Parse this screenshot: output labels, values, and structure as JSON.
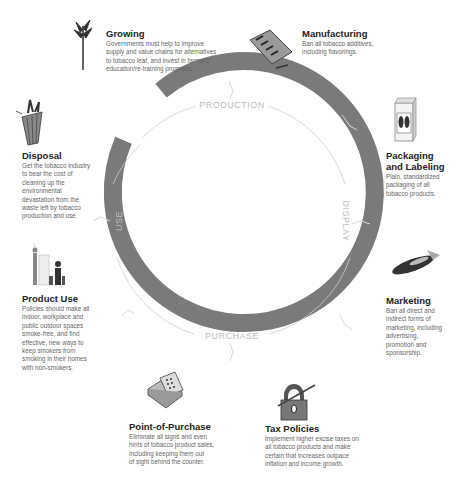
{
  "diagram": {
    "ring": {
      "center": [
        231,
        221
      ],
      "outer_radius": 140,
      "thickness": 18,
      "inner_guide_radius": 119,
      "ring_color": "#7a7a7a",
      "guide_color": "#cfcfcf",
      "label_color": "#bdbdbd"
    },
    "phases": [
      {
        "label": "PRODUCTION"
      },
      {
        "label": "DISPLAY"
      },
      {
        "label": "PURCHASE"
      },
      {
        "label": "USE"
      }
    ],
    "stages": [
      {
        "id": "growing",
        "title": "Growing",
        "lines": [
          "Governments must help to improve",
          "supply and value chains for alternatives",
          "to tobacco leaf, and invest in farmers’",
          "education/re-training programs."
        ],
        "icon": "tobacco-plant-icon"
      },
      {
        "id": "manufacturing",
        "title": "Manufacturing",
        "lines": [
          "Ban all tobacco additives,",
          "including flavorings."
        ],
        "icon": "cigarette-machine-icon"
      },
      {
        "id": "packaging",
        "title_lines": [
          "Packaging",
          "and Labeling"
        ],
        "lines": [
          "Plain, standardized",
          "packaging of all",
          "tobacco products."
        ],
        "icon": "cigarette-pack-icon"
      },
      {
        "id": "marketing",
        "title": "Marketing",
        "lines": [
          "Ban all direct and",
          "indirect forms of",
          "marketing, including",
          "advertising,",
          "promotion and",
          "sponsorship."
        ],
        "icon": "blimp-icon"
      },
      {
        "id": "tax",
        "title": "Tax Policies",
        "lines": [
          "Implement higher excise taxes on",
          "all tobacco products and make",
          "certain that increases outpace",
          "inflation and income growth."
        ],
        "icon": "padlock-icon"
      },
      {
        "id": "pop",
        "title": "Point-of-Purchase",
        "lines": [
          "Eliminate all signs and even",
          "hints of tobacco product sales,",
          "including keeping them out",
          "of sight behind the counter."
        ],
        "icon": "cash-register-icon"
      },
      {
        "id": "use",
        "title": "Product Use",
        "lines": [
          "Policies should make all",
          "indoor, workplace and",
          "public outdoor spaces",
          "smoke-free, and find",
          "effective, new ways to",
          "keep smokers from",
          "smoking in their homes",
          "with non-smokers."
        ],
        "icon": "smokers-icon"
      },
      {
        "id": "disposal",
        "title": "Disposal",
        "lines": [
          "Get the tobacco industry",
          "to bear the cost of",
          "cleaning up the",
          "environmental",
          "devastation from the",
          "waste left by tobacco",
          "production and use."
        ],
        "icon": "trash-bin-icon"
      }
    ]
  }
}
